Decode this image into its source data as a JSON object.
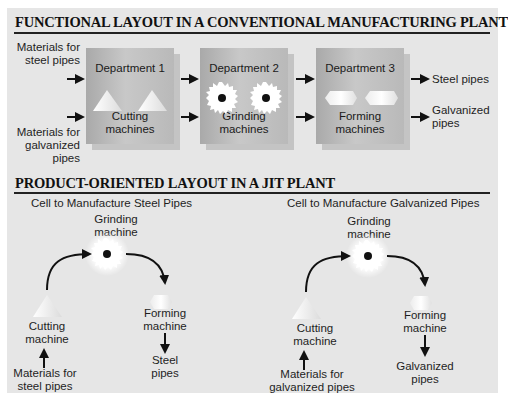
{
  "functional_layout": {
    "title": "FUNCTIONAL LAYOUT IN A CONVENTIONAL MANUFACTURING PLANT",
    "inputs": {
      "steel": [
        "Materials for",
        "steel pipes"
      ],
      "galvanized": [
        "Materials for",
        "galvanized",
        "pipes"
      ]
    },
    "departments": [
      {
        "name": "Department 1",
        "machines": [
          "Cutting",
          "machines"
        ],
        "icon": "triangle-icon"
      },
      {
        "name": "Department 2",
        "machines": [
          "Grinding",
          "machines"
        ],
        "icon": "grinding-wheel-icon"
      },
      {
        "name": "Department 3",
        "machines": [
          "Forming",
          "machines"
        ],
        "icon": "octagon-icon"
      }
    ],
    "outputs": {
      "steel": "Steel pipes",
      "galvanized": [
        "Galvanized",
        "pipes"
      ]
    }
  },
  "product_layout": {
    "title": "PRODUCT-ORIENTED LAYOUT IN A JIT PLANT",
    "cells": [
      {
        "title": "Cell to Manufacture Steel Pipes",
        "grinding": [
          "Grinding",
          "machine"
        ],
        "cutting": [
          "Cutting",
          "machine"
        ],
        "forming": [
          "Forming",
          "machine"
        ],
        "input": [
          "Materials for",
          "steel pipes"
        ],
        "output": [
          "Steel",
          "pipes"
        ]
      },
      {
        "title": "Cell to Manufacture Galvanized Pipes",
        "grinding": [
          "Grinding",
          "machine"
        ],
        "cutting": [
          "Cutting",
          "machine"
        ],
        "forming": [
          "Forming",
          "machine"
        ],
        "input": [
          "Materials for",
          "galvanized pipes"
        ],
        "output": [
          "Galvanized",
          "pipes"
        ]
      }
    ]
  },
  "colors": {
    "panel_bg": "#e6e6e6",
    "department_box": "#b5b5b5",
    "arrow": "#111111",
    "machine_fill": "#ffffff"
  }
}
